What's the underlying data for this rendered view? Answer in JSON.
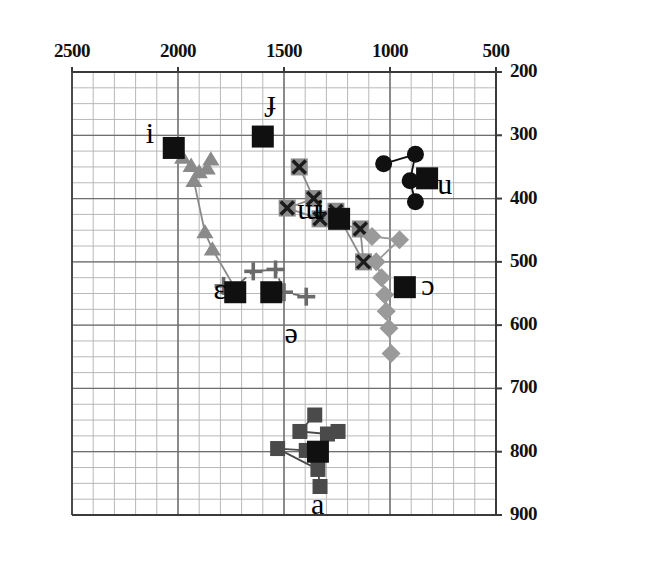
{
  "chart_data": {
    "type": "scatter",
    "title": "",
    "subtitle": "",
    "xlabel": "",
    "ylabel": "",
    "xlim": [
      2500,
      500
    ],
    "ylim": [
      900,
      200
    ],
    "x_axis_position": "top",
    "y_axis_position": "right",
    "x_reversed": true,
    "y_reversed": true,
    "grid": true,
    "grid_major_x_step": 500,
    "grid_major_y_step": 100,
    "grid_minor_x_step": 100,
    "grid_minor_y_step": 25,
    "xticks": [
      2500,
      2000,
      1500,
      1000,
      500
    ],
    "yticks": [
      200,
      300,
      400,
      500,
      600,
      700,
      800,
      900
    ],
    "xtick_labels": [
      "2500",
      "2000",
      "1500",
      "1000",
      "500"
    ],
    "ytick_labels": [
      "200",
      "300",
      "400",
      "500",
      "600",
      "700",
      "800",
      "900"
    ],
    "legend": [],
    "legend_position": "none",
    "annotations": [
      {
        "text": "i",
        "x": 2110,
        "y": 305,
        "name": "vowel-label-i"
      },
      {
        "text": "ɟ",
        "x": 1540,
        "y": 253,
        "name": "vowel-label-barred-dotless-j"
      },
      {
        "text": "ɯ",
        "x": 1395,
        "y": 425,
        "name": "vowel-label-turned-m"
      },
      {
        "text": "ɨ",
        "x": 1305,
        "y": 425,
        "name": "vowel-label-barred-i"
      },
      {
        "text": "u",
        "x": 735,
        "y": 385,
        "name": "vowel-label-u"
      },
      {
        "text": "ɛ",
        "x": 1790,
        "y": 550,
        "name": "vowel-label-open-e"
      },
      {
        "text": "ɔ",
        "x": 810,
        "y": 545,
        "name": "vowel-label-open-o"
      },
      {
        "text": "ə",
        "x": 1455,
        "y": 620,
        "name": "vowel-label-schwa"
      },
      {
        "text": "a",
        "x": 1330,
        "y": 890,
        "name": "vowel-label-a"
      }
    ],
    "series": [
      {
        "name": "i-series",
        "marker": "triangle",
        "color": "#8a8a8a",
        "line": "solid",
        "points": [
          {
            "x": 1978,
            "y": 335
          },
          {
            "x": 1938,
            "y": 348
          },
          {
            "x": 1900,
            "y": 358
          },
          {
            "x": 1862,
            "y": 352
          },
          {
            "x": 1845,
            "y": 338
          },
          {
            "x": 1925,
            "y": 372
          },
          {
            "x": 1873,
            "y": 453
          },
          {
            "x": 1838,
            "y": 480
          },
          {
            "x": 1725,
            "y": 545
          }
        ]
      },
      {
        "name": "central-series",
        "marker": "x-box",
        "color": "#8c8c8c",
        "line": "solid",
        "points": [
          {
            "x": 1428,
            "y": 350
          },
          {
            "x": 1360,
            "y": 400
          },
          {
            "x": 1485,
            "y": 415
          },
          {
            "x": 1330,
            "y": 432
          },
          {
            "x": 1140,
            "y": 448
          },
          {
            "x": 1125,
            "y": 500
          },
          {
            "x": 1255,
            "y": 420
          }
        ]
      },
      {
        "name": "u-series",
        "marker": "circle",
        "color": "#101010",
        "line": "solid",
        "points": [
          {
            "x": 1030,
            "y": 345
          },
          {
            "x": 880,
            "y": 330
          },
          {
            "x": 905,
            "y": 372
          },
          {
            "x": 880,
            "y": 405
          }
        ]
      },
      {
        "name": "o-series",
        "marker": "diamond",
        "color": "#9a9a9a",
        "line": "solid",
        "points": [
          {
            "x": 1085,
            "y": 460
          },
          {
            "x": 955,
            "y": 465
          },
          {
            "x": 1065,
            "y": 500
          },
          {
            "x": 1040,
            "y": 525
          },
          {
            "x": 1025,
            "y": 552
          },
          {
            "x": 1018,
            "y": 578
          },
          {
            "x": 1005,
            "y": 605
          },
          {
            "x": 995,
            "y": 645
          }
        ]
      },
      {
        "name": "schwa-series",
        "marker": "plus",
        "color": "#6a6a6a",
        "line": "dashed",
        "points": [
          {
            "x": 1785,
            "y": 538
          },
          {
            "x": 1760,
            "y": 548
          },
          {
            "x": 1645,
            "y": 515
          },
          {
            "x": 1540,
            "y": 512
          },
          {
            "x": 1500,
            "y": 548
          },
          {
            "x": 1395,
            "y": 555
          }
        ]
      },
      {
        "name": "a-series",
        "marker": "square",
        "color": "#4a4a4a",
        "line": "solid",
        "points": [
          {
            "x": 1355,
            "y": 742
          },
          {
            "x": 1425,
            "y": 768
          },
          {
            "x": 1295,
            "y": 772
          },
          {
            "x": 1245,
            "y": 768
          },
          {
            "x": 1395,
            "y": 798
          },
          {
            "x": 1530,
            "y": 795
          },
          {
            "x": 1340,
            "y": 828
          },
          {
            "x": 1330,
            "y": 855
          }
        ]
      }
    ],
    "mean_markers": [
      {
        "name": "mean-i",
        "x": 2020,
        "y": 320,
        "label": "i"
      },
      {
        "name": "mean-barred",
        "x": 1600,
        "y": 302,
        "label": "ɟ"
      },
      {
        "name": "mean-turnedm",
        "x": 1240,
        "y": 432,
        "label": "ɯɨ"
      },
      {
        "name": "mean-u",
        "x": 825,
        "y": 368,
        "label": "u"
      },
      {
        "name": "mean-e",
        "x": 1730,
        "y": 548,
        "label": "ɛ"
      },
      {
        "name": "mean-o",
        "x": 930,
        "y": 540,
        "label": "ɔ"
      },
      {
        "name": "mean-schwa",
        "x": 1560,
        "y": 548,
        "label": "ə"
      },
      {
        "name": "mean-a",
        "x": 1340,
        "y": 800,
        "label": "a"
      }
    ]
  },
  "colors": {
    "grid_minor": "#b8b8b8",
    "grid_major": "#6f6f6f",
    "axis": "#3a3a3a",
    "marker_black": "#101010",
    "marker_gray": "#8c8c8c",
    "marker_dark_gray": "#4a4a4a",
    "background": "#ffffff"
  }
}
